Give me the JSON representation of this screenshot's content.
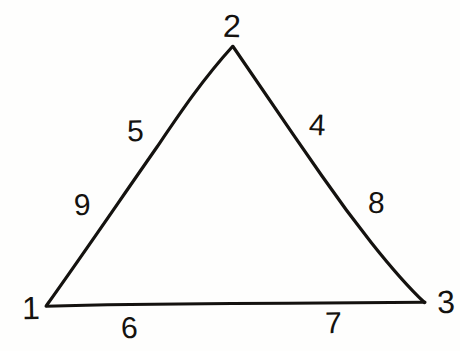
{
  "figure": {
    "kind": "triangle-diagram",
    "caption": "",
    "ink_color": "#14120f",
    "paper_color": "#fefefd",
    "stroke_width": 3,
    "vertices": [
      {
        "id": "vertex-1",
        "label": "1",
        "x": 46,
        "y": 306,
        "label_x": 22,
        "label_y": 292,
        "rot": "rot-c"
      },
      {
        "id": "vertex-2",
        "label": "2",
        "x": 233,
        "y": 46,
        "label_x": 223,
        "label_y": 10,
        "rot": "rot-b"
      },
      {
        "id": "vertex-3",
        "label": "3",
        "x": 425,
        "y": 302,
        "label_x": 437,
        "label_y": 286,
        "rot": "rot-a"
      }
    ],
    "edges": [
      {
        "id": "edge-left",
        "from": "vertex-1",
        "to": "vertex-2"
      },
      {
        "id": "edge-right",
        "from": "vertex-2",
        "to": "vertex-3"
      },
      {
        "id": "edge-bottom",
        "from": "vertex-1",
        "to": "vertex-3"
      }
    ],
    "edge_labels": [
      {
        "id": "edge-label-9",
        "label": "9",
        "edge": "edge-left",
        "x": 74,
        "y": 190,
        "rot": "rot-a"
      },
      {
        "id": "edge-label-5",
        "label": "5",
        "edge": "edge-left",
        "x": 127,
        "y": 116,
        "rot": "rot-c"
      },
      {
        "id": "edge-label-4",
        "label": "4",
        "edge": "edge-right",
        "x": 309,
        "y": 110,
        "rot": "rot-d"
      },
      {
        "id": "edge-label-8",
        "label": "8",
        "edge": "edge-right",
        "x": 368,
        "y": 188,
        "rot": "rot-b"
      },
      {
        "id": "edge-label-6",
        "label": "6",
        "edge": "edge-bottom",
        "x": 121,
        "y": 313,
        "rot": "rot-e"
      },
      {
        "id": "edge-label-7",
        "label": "7",
        "edge": "edge-bottom",
        "x": 325,
        "y": 308,
        "rot": "rot-c"
      }
    ]
  }
}
